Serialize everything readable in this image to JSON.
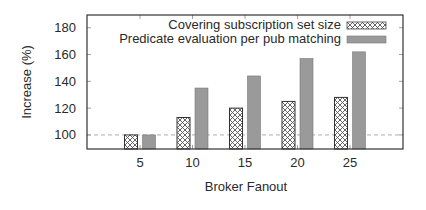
{
  "chart_data": {
    "type": "bar",
    "title": "",
    "xlabel": "Broker Fanout",
    "ylabel": "Increase (%)",
    "categories": [
      "5",
      "10",
      "15",
      "20",
      "25"
    ],
    "series": [
      {
        "name": "Covering subscription set size",
        "pattern": "crosshatch",
        "values": [
          100,
          113,
          120,
          125,
          128
        ]
      },
      {
        "name": "Predicate evaluation per pub matching",
        "pattern": "solid-gray",
        "values": [
          100,
          135,
          144,
          157,
          162
        ]
      }
    ],
    "ylim": [
      89.5,
      189.5
    ],
    "yticks": [
      "100",
      "120",
      "140",
      "160",
      "180"
    ],
    "reference_line": 100,
    "grid": false,
    "legend_position": "top-right",
    "colors": {
      "axis": "#333333",
      "solid_bar": "#9a9a9a",
      "hatch_fill": "#ffffff",
      "hatch_stroke": "#444444"
    }
  }
}
